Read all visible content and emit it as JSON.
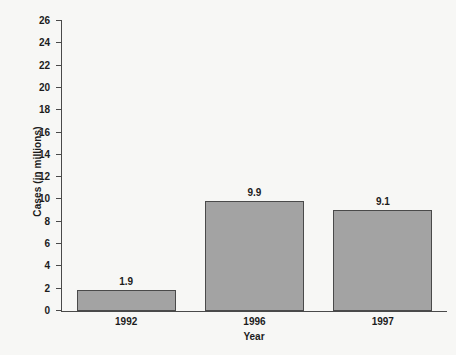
{
  "chart_data": {
    "type": "bar",
    "title": "",
    "xlabel": "Year",
    "ylabel": "Cases (in millions)",
    "categories": [
      "1992",
      "1996",
      "1997"
    ],
    "values": [
      1.9,
      9.9,
      9.1
    ],
    "value_labels": [
      "1.9",
      "9.9",
      "9.1"
    ],
    "ylim": [
      0,
      26
    ],
    "ytick_labels": [
      "0",
      "2",
      "4",
      "6",
      "8",
      "10",
      "12",
      "14",
      "16",
      "18",
      "20",
      "22",
      "24",
      "26"
    ],
    "ytick_values": [
      0,
      2,
      4,
      6,
      8,
      10,
      12,
      14,
      16,
      18,
      20,
      22,
      24,
      26
    ],
    "grid": false,
    "legend": null,
    "bar_color": "#a3a3a3",
    "bar_border_color": "#4a4a4a",
    "axis_color": "#4a4a4a",
    "text_color": "#1c1c1c",
    "background_color": "#f7f7f5"
  }
}
